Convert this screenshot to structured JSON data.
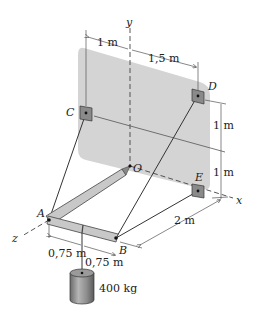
{
  "figure": {
    "type": "3D statics diagram: boom supported by cables from vertical wall",
    "points": {
      "O": "O",
      "A": "A",
      "B": "B",
      "C": "C",
      "D": "D",
      "E": "E"
    },
    "axes": {
      "x": "x",
      "y": "y",
      "z": "z"
    },
    "dimensions": {
      "c_to_y": "1 m",
      "y_to_d": "1,5 m",
      "d_drop": "1 m",
      "e_drop": "1 m",
      "depth_to_b": "2 m",
      "a_to_load": "0,75 m",
      "load_to_b": "0,75 m"
    },
    "load": {
      "label": "400 kg"
    },
    "colors": {
      "wall": "#d4d4d4",
      "bracket": "#8a8a8a",
      "boom": "#c8c8c8",
      "line": "#333333"
    }
  }
}
